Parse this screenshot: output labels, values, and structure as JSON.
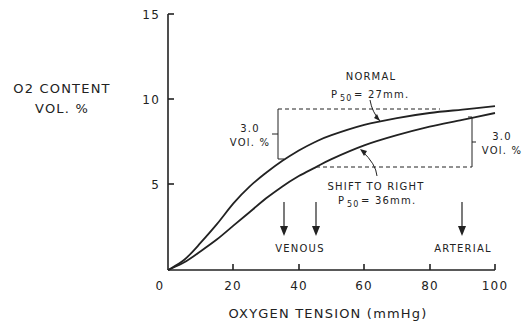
{
  "chart_data": {
    "type": "line",
    "title": "",
    "xlabel": "OXYGEN TENSION (mmHg)",
    "ylabel_line1": "O2 CONTENT",
    "ylabel_line2": "VOL. %",
    "xlim": [
      0,
      100
    ],
    "ylim": [
      0,
      15
    ],
    "x_ticks": [
      "0",
      "20",
      "40",
      "60",
      "80",
      "100"
    ],
    "y_ticks": [
      "5",
      "10",
      "15"
    ],
    "grid": false,
    "series": [
      {
        "name": "NORMAL p50 = 27mm.",
        "x": [
          0,
          5,
          10,
          15,
          20,
          25,
          30,
          35,
          40,
          45,
          50,
          60,
          70,
          80,
          90,
          100
        ],
        "y": [
          0,
          0.6,
          1.6,
          2.7,
          3.9,
          4.9,
          5.7,
          6.4,
          7.0,
          7.5,
          7.9,
          8.5,
          8.9,
          9.2,
          9.4,
          9.6
        ]
      },
      {
        "name": "SHIFT TO RIGHT p50 = 36mm.",
        "x": [
          0,
          5,
          10,
          15,
          20,
          25,
          30,
          35,
          40,
          45,
          50,
          60,
          70,
          80,
          90,
          100
        ],
        "y": [
          0,
          0.45,
          1.1,
          1.8,
          2.6,
          3.4,
          4.2,
          4.9,
          5.5,
          6.0,
          6.5,
          7.3,
          7.9,
          8.4,
          8.8,
          9.2
        ]
      }
    ],
    "annotations": {
      "normal_label": "NORMAL",
      "normal_p50": "= 27mm.",
      "shift_label": "SHIFT TO RIGHT",
      "shift_p50": "= 36mm.",
      "p_symbol": "P",
      "p_sub": "50",
      "left_bracket_value": "3.0",
      "left_bracket_unit": "VOl. %",
      "right_bracket_value": "3.0",
      "right_bracket_unit": "VOl. %",
      "venous_label": "VENOUS",
      "venous_arrows_x": [
        35,
        45
      ],
      "arterial_label": "ARTERIAL",
      "arterial_arrow_x": 90
    }
  }
}
